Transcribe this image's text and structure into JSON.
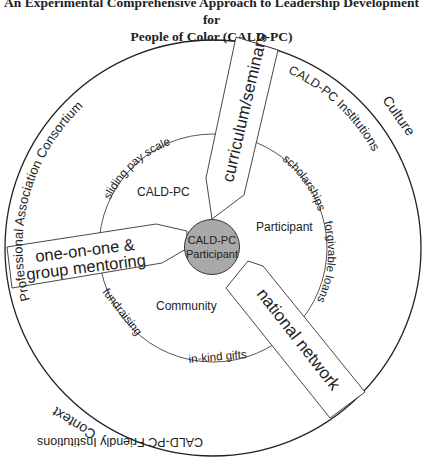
{
  "title": {
    "line1": "An Experimental Comprehensive Approach to Leadership Development for",
    "line2": "People of Color (CALD-PC)"
  },
  "center": {
    "line1": "CALD-PC",
    "line2": "Participant",
    "fill": "#a9a9a9"
  },
  "inner_sectors": {
    "top_left": "CALD-PC",
    "right": "Participant",
    "bottom": "Community"
  },
  "inner_ring_labels": {
    "sliding_pay_scale": "sliding pay scale",
    "scholarships": "scholarships",
    "forgivable_loans": "forgivable loans",
    "fundraising": "fundraising",
    "in_kind_gifts": "in-kind gifts"
  },
  "outer_ring_labels": {
    "professional_association": "Professional Association Consortium",
    "culture": "Culture",
    "cald_pc_institutions": "CALD-PC Institutions",
    "context": "Context",
    "cald_pc_friendly": "CALD-PC Friendly Institutions"
  },
  "spokes": {
    "curriculum": "curriculum/seminars",
    "mentoring_line1": "one-on-one &",
    "mentoring_line2": "group mentoring",
    "national_network": "national network"
  }
}
